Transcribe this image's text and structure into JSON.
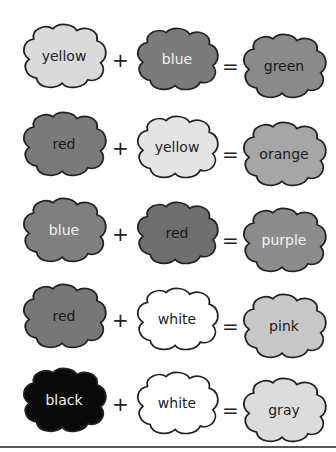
{
  "equations": [
    {
      "a": {
        "label": "yellow",
        "fill": "#dadada",
        "text": "#222"
      },
      "b": {
        "label": "blue",
        "fill": "#7b7b7b",
        "text": "#f2f2f2"
      },
      "result": {
        "label": "green",
        "fill": "#8a8a8a",
        "text": "#1a1a1a"
      }
    },
    {
      "a": {
        "label": "red",
        "fill": "#7a7a7a",
        "text": "#1a1a1a"
      },
      "b": {
        "label": "yellow",
        "fill": "#e4e4e4",
        "text": "#222"
      },
      "result": {
        "label": "orange",
        "fill": "#a6a6a6",
        "text": "#1a1a1a"
      }
    },
    {
      "a": {
        "label": "blue",
        "fill": "#7f7f7f",
        "text": "#f2f2f2"
      },
      "b": {
        "label": "red",
        "fill": "#6f6f6f",
        "text": "#1a1a1a"
      },
      "result": {
        "label": "purple",
        "fill": "#8c8c8c",
        "text": "#f2f2f2"
      }
    },
    {
      "a": {
        "label": "red",
        "fill": "#777777",
        "text": "#1a1a1a"
      },
      "b": {
        "label": "white",
        "fill": "#ffffff",
        "text": "#222"
      },
      "result": {
        "label": "pink",
        "fill": "#c7c7c7",
        "text": "#1a1a1a"
      }
    },
    {
      "a": {
        "label": "black",
        "fill": "#0a0a0a",
        "text": "#f2f2f2"
      },
      "b": {
        "label": "white",
        "fill": "#ffffff",
        "text": "#222"
      },
      "result": {
        "label": "gray",
        "fill": "#dcdcdc",
        "text": "#222"
      }
    }
  ],
  "operators": {
    "plus": "+",
    "equals": "="
  }
}
